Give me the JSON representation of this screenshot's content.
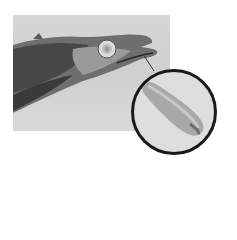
{
  "image": {
    "description": "Photograph of a fish head (lancetfish-like) with mouth open; a line points from the mouth to a circular magnified inset showing an elongated pale parasite.",
    "main_photo": {
      "subject": "fish-head",
      "background_color": "#d4d4d4"
    },
    "inset": {
      "subject": "parasite-closeup",
      "border_color": "#1a1a1a",
      "background_color": "#dedede"
    },
    "colors": {
      "fish_dark": "#3a3a3a",
      "fish_mid": "#7a7a7a",
      "fish_light": "#b8b8b8",
      "eye": "#e6e6e6",
      "parasite": "#a8a8a8"
    }
  }
}
